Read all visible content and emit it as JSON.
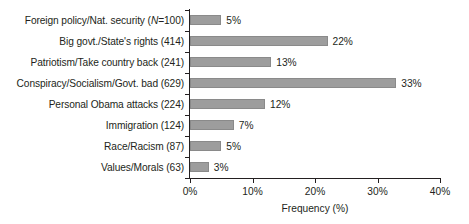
{
  "chart_data": {
    "type": "bar",
    "orientation": "horizontal",
    "title": "",
    "xlabel": "Frequency (%)",
    "ylabel": "",
    "xlim": [
      0,
      40
    ],
    "xticks": [
      0,
      10,
      20,
      30,
      40
    ],
    "xtick_labels": [
      "0%",
      "10%",
      "20%",
      "30%",
      "40%"
    ],
    "grid": false,
    "legend": null,
    "bar_color": "#9d9d9d",
    "categories": [
      "Foreign policy/Nat. security (N=100)",
      "Big govt./State's rights (414)",
      "Patriotism/Take country back (241)",
      "Conspiracy/Socialism/Govt. bad (629)",
      "Personal Obama attacks (224)",
      "Immigration (124)",
      "Race/Racism (87)",
      "Values/Morals (63)"
    ],
    "values": [
      5,
      22,
      13,
      33,
      12,
      7,
      5,
      3
    ],
    "value_labels": [
      "5%",
      "22%",
      "13%",
      "33%",
      "12%",
      "7%",
      "5%",
      "3%"
    ],
    "category_parts": [
      {
        "pre": "Foreign policy/Nat. security (",
        "ital": "N",
        "post": "=100)"
      },
      {
        "pre": "Big govt./State's rights (414)",
        "ital": "",
        "post": ""
      },
      {
        "pre": "Patriotism/Take country back (241)",
        "ital": "",
        "post": ""
      },
      {
        "pre": "Conspiracy/Socialism/Govt. bad (629)",
        "ital": "",
        "post": ""
      },
      {
        "pre": "Personal Obama attacks (224)",
        "ital": "",
        "post": ""
      },
      {
        "pre": "Immigration (124)",
        "ital": "",
        "post": ""
      },
      {
        "pre": "Race/Racism (87)",
        "ital": "",
        "post": ""
      },
      {
        "pre": "Values/Morals (63)",
        "ital": "",
        "post": ""
      }
    ],
    "counts": [
      100,
      414,
      241,
      629,
      224,
      124,
      87,
      63
    ]
  }
}
